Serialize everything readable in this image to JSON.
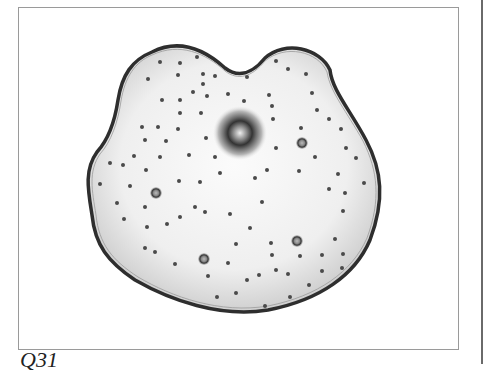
{
  "figure": {
    "caption": "Q31",
    "colors": {
      "membrane": "#2e2e2e",
      "cytoplasm_light": "#fafafa",
      "cytoplasm_dark": "#c8c8c8",
      "granule": "#4a4a4a"
    },
    "nucleus": {
      "cx": 240,
      "cy": 133,
      "r": 26
    },
    "vacuoles": [
      {
        "cx": 302,
        "cy": 143,
        "r": 5
      },
      {
        "cx": 156,
        "cy": 193,
        "r": 5
      },
      {
        "cx": 297,
        "cy": 241,
        "r": 5
      },
      {
        "cx": 204,
        "cy": 259,
        "r": 5
      }
    ]
  }
}
